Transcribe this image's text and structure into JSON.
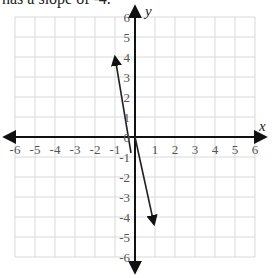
{
  "caption": "has a slope of -4.",
  "chart_data": {
    "type": "line",
    "title": "has a slope of -4.",
    "xlabel": "x",
    "ylabel": "y",
    "xlim": [
      -6,
      6
    ],
    "ylim": [
      -6,
      6
    ],
    "grid": true,
    "x_ticks": [
      "-6",
      "-5",
      "-4",
      "-3",
      "-2",
      "-1",
      "0",
      "1",
      "2",
      "3",
      "4",
      "5",
      "6"
    ],
    "y_ticks": [
      "6",
      "5",
      "4",
      "3",
      "2",
      "1",
      "0",
      "-1",
      "-2",
      "-3",
      "-4",
      "-5",
      "-6"
    ],
    "series": [
      {
        "name": "line",
        "slope": -4,
        "intercept": 0,
        "points": [
          [
            -1,
            4
          ],
          [
            1,
            -4
          ]
        ]
      }
    ]
  },
  "axes": {
    "x_label": "x",
    "y_label": "y"
  },
  "ticks": {
    "x": [
      "-6",
      "-5",
      "-4",
      "-3",
      "-2",
      "-1",
      "1",
      "2",
      "3",
      "4",
      "5",
      "6"
    ],
    "y": [
      "6",
      "5",
      "4",
      "3",
      "2",
      "1",
      "0",
      "-1",
      "-2",
      "-3",
      "-4",
      "-5",
      "-6"
    ]
  },
  "colors": {
    "grid": "#d9d9d9",
    "axis": "#111111",
    "line": "#222222",
    "tick_text": "#555555"
  }
}
